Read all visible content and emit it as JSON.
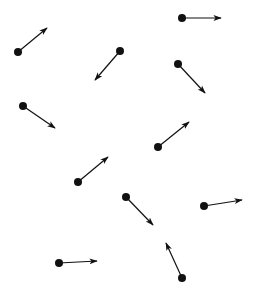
{
  "diagram": {
    "type": "vector-field-particles",
    "width": 255,
    "height": 293,
    "background": "#ffffff",
    "ink_color": "#111111",
    "dot_radius": 4,
    "stroke_width": 1.2,
    "arrows": [
      {
        "id": 1,
        "dot": [
          18,
          52
        ],
        "tip": [
          47,
          28
        ]
      },
      {
        "id": 2,
        "dot": [
          182,
          18
        ],
        "tip": [
          221,
          18
        ]
      },
      {
        "id": 3,
        "dot": [
          120,
          51
        ],
        "tip": [
          95,
          80
        ]
      },
      {
        "id": 4,
        "dot": [
          178,
          64
        ],
        "tip": [
          205,
          93
        ]
      },
      {
        "id": 5,
        "dot": [
          23,
          106
        ],
        "tip": [
          55,
          128
        ]
      },
      {
        "id": 6,
        "dot": [
          158,
          147
        ],
        "tip": [
          189,
          122
        ]
      },
      {
        "id": 7,
        "dot": [
          78,
          182
        ],
        "tip": [
          108,
          157
        ]
      },
      {
        "id": 8,
        "dot": [
          126,
          197
        ],
        "tip": [
          153,
          225
        ]
      },
      {
        "id": 9,
        "dot": [
          204,
          206
        ],
        "tip": [
          242,
          200
        ]
      },
      {
        "id": 10,
        "dot": [
          59,
          263
        ],
        "tip": [
          97,
          261
        ]
      },
      {
        "id": 11,
        "dot": [
          182,
          278
        ],
        "tip": [
          166,
          243
        ]
      }
    ]
  }
}
